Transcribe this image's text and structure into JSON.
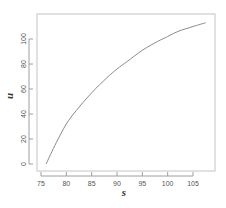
{
  "chart_data": {
    "type": "line",
    "title": "",
    "xlabel": "s",
    "ylabel": "u",
    "xlim": [
      74.5,
      108.5
    ],
    "ylim": [
      -4,
      122
    ],
    "x_ticks": [
      75,
      80,
      85,
      90,
      95,
      100,
      105
    ],
    "y_ticks": [
      0,
      20,
      40,
      60,
      80,
      100
    ],
    "grid": false,
    "legend": null,
    "series": [
      {
        "name": "u(s)",
        "color": "#8a8a8a",
        "x": [
          76,
          78,
          80,
          82,
          85,
          88,
          90,
          92,
          95,
          98,
          100,
          102,
          105,
          107.5
        ],
        "y": [
          0,
          17,
          32,
          43,
          57,
          69,
          76,
          82,
          91,
          98,
          102,
          106,
          110,
          113
        ]
      }
    ]
  },
  "colors": {
    "frame": "#bdbdbd",
    "axis": "#9e9e9e",
    "curve": "#8a8a8a",
    "text": "#555555"
  }
}
